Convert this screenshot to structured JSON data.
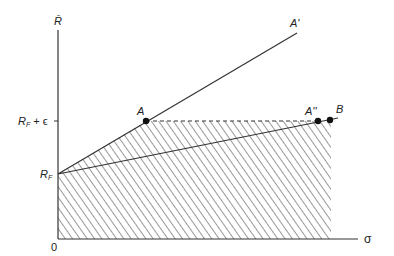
{
  "diagram": {
    "y_axis_label": "R̄",
    "x_axis_label": "σ",
    "origin_label": "0",
    "y_ticks": [
      {
        "label": "R_F + ε",
        "main": "R",
        "sub": "F",
        "suffix": "+ ϵ"
      },
      {
        "label": "R_F",
        "main": "R",
        "sub": "F"
      }
    ],
    "points": {
      "A": {
        "label": "A"
      },
      "A_prime": {
        "label": "A'"
      },
      "A_double_prime": {
        "label": "A''"
      },
      "B": {
        "label": "B"
      }
    },
    "lines": [
      {
        "name": "line-RF-to-A-prime",
        "from": "R_F",
        "to": "A'",
        "style": "solid"
      },
      {
        "name": "line-RF-to-B",
        "from": "R_F",
        "to": "B",
        "style": "solid"
      },
      {
        "name": "line-A-to-A-double-prime",
        "from": "A",
        "to": "A''",
        "style": "dashed"
      }
    ],
    "shaded_region": "hatched area under R_F–A line and dashed line at R_F + ε, bounded right at B"
  }
}
